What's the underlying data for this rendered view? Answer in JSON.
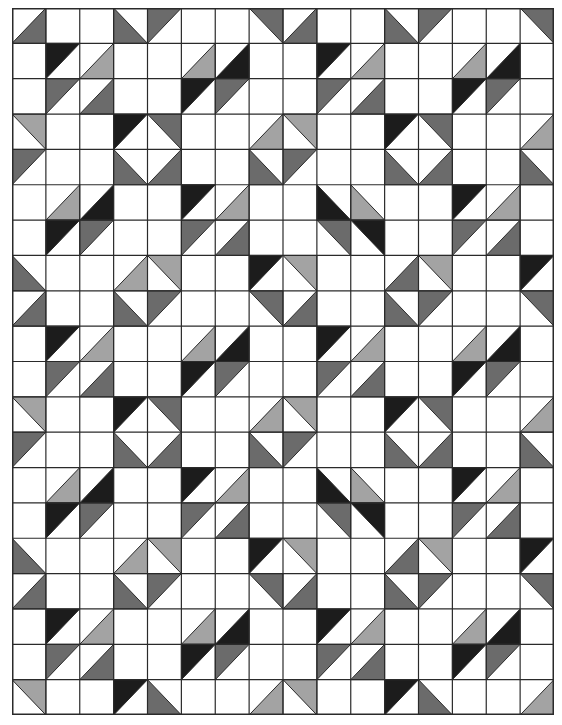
{
  "grid": {
    "cols": 16,
    "rows": 20,
    "line_color": "#2a2a2a",
    "background": "#ffffff"
  },
  "shades": {
    "d": "#1c1c1c",
    "m": "#6b6b6b",
    "l": "#a3a3a3"
  },
  "cells": [
    [
      "br-m",
      "",
      "",
      "bl-m",
      "tl-m",
      "",
      "",
      "tr-m",
      "br-m",
      "",
      "",
      "bl-m",
      "tl-m",
      "",
      "",
      "tr-m"
    ],
    [
      "",
      "tl-d",
      "br-l",
      "",
      "",
      "br-l",
      "br-d",
      "",
      "",
      "tl-d",
      "br-l",
      "",
      "",
      "br-l",
      "br-d",
      ""
    ],
    [
      "",
      "tl-m",
      "br-m",
      "",
      "",
      "tl-d",
      "tl-m",
      "",
      "",
      "tl-m",
      "br-m",
      "",
      "",
      "tl-d",
      "tl-m",
      ""
    ],
    [
      "tr-l",
      "",
      "",
      "tl-d",
      "tr-m",
      "",
      "",
      "br-l",
      "tr-l",
      "",
      "",
      "tl-d",
      "tr-m",
      "",
      "",
      "br-l"
    ],
    [
      "tl-m",
      "",
      "",
      "bl-m",
      "br-m",
      "",
      "",
      "bl-m",
      "tl-m",
      "",
      "",
      "bl-m",
      "br-m",
      "",
      "",
      "bl-m"
    ],
    [
      "",
      "br-l",
      "br-d",
      "",
      "",
      "tl-d",
      "br-l",
      "",
      "",
      "bl-d",
      "bl-l",
      "",
      "",
      "tl-d",
      "br-l",
      ""
    ],
    [
      "",
      "tl-d",
      "tl-m",
      "",
      "",
      "tl-m",
      "br-m",
      "",
      "",
      "tr-m",
      "tr-d",
      "",
      "",
      "tl-m",
      "br-m",
      ""
    ],
    [
      "bl-m",
      "",
      "",
      "br-l",
      "tr-l",
      "",
      "",
      "tl-d",
      "tr-l",
      "",
      "",
      "br-m",
      "tr-l",
      "",
      "",
      "tl-d"
    ],
    [
      "br-m",
      "",
      "",
      "bl-m",
      "tl-m",
      "",
      "",
      "tr-m",
      "br-m",
      "",
      "",
      "bl-m",
      "tl-m",
      "",
      "",
      "tr-m"
    ],
    [
      "",
      "tl-d",
      "br-l",
      "",
      "",
      "br-l",
      "br-d",
      "",
      "",
      "tl-d",
      "br-l",
      "",
      "",
      "br-l",
      "br-d",
      ""
    ],
    [
      "",
      "tl-m",
      "br-m",
      "",
      "",
      "tl-d",
      "tl-m",
      "",
      "",
      "tl-m",
      "br-m",
      "",
      "",
      "tl-d",
      "tl-m",
      ""
    ],
    [
      "tr-l",
      "",
      "",
      "tl-d",
      "tr-m",
      "",
      "",
      "br-l",
      "tr-l",
      "",
      "",
      "tl-d",
      "tr-m",
      "",
      "",
      "br-l"
    ],
    [
      "tl-m",
      "",
      "",
      "bl-m",
      "br-m",
      "",
      "",
      "bl-m",
      "tl-m",
      "",
      "",
      "bl-m",
      "br-m",
      "",
      "",
      "bl-m"
    ],
    [
      "",
      "br-l",
      "br-d",
      "",
      "",
      "tl-d",
      "br-l",
      "",
      "",
      "bl-d",
      "bl-l",
      "",
      "",
      "tl-d",
      "br-l",
      ""
    ],
    [
      "",
      "tl-d",
      "tl-m",
      "",
      "",
      "tl-m",
      "br-m",
      "",
      "",
      "tr-m",
      "tr-d",
      "",
      "",
      "tl-m",
      "br-m",
      ""
    ],
    [
      "bl-m",
      "",
      "",
      "br-l",
      "tr-l",
      "",
      "",
      "tl-d",
      "tr-l",
      "",
      "",
      "br-m",
      "tr-l",
      "",
      "",
      "tl-d"
    ],
    [
      "br-m",
      "",
      "",
      "bl-m",
      "tl-m",
      "",
      "",
      "tr-m",
      "br-m",
      "",
      "",
      "bl-m",
      "tl-m",
      "",
      "",
      "tr-m"
    ],
    [
      "",
      "tl-d",
      "br-l",
      "",
      "",
      "br-l",
      "br-d",
      "",
      "",
      "tl-d",
      "br-l",
      "",
      "",
      "br-l",
      "br-d",
      ""
    ],
    [
      "",
      "tl-m",
      "br-m",
      "",
      "",
      "tl-d",
      "tl-m",
      "",
      "",
      "tl-m",
      "br-m",
      "",
      "",
      "tl-d",
      "tl-m",
      ""
    ],
    [
      "tr-l",
      "",
      "",
      "tl-d",
      "bl-m",
      "",
      "",
      "br-l",
      "tr-l",
      "",
      "",
      "tl-d",
      "bl-m",
      "",
      "",
      "br-l"
    ]
  ]
}
